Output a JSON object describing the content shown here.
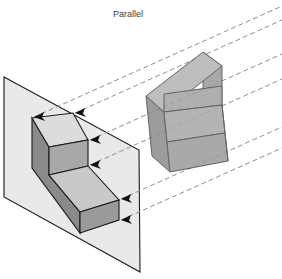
{
  "figure": {
    "title": "Parallel",
    "title_position": {
      "x": 128,
      "y": 17
    },
    "canvas": {
      "width": 282,
      "height": 279
    },
    "background_color": "#ffffff",
    "description_type": "parallel-projection-diagram"
  },
  "colors": {
    "background": "#ffffff",
    "plane_fill": "#e9e9e9",
    "plane_stroke": "#1a1a1a",
    "projected_top_fill": "#dcdcdc",
    "projected_front_fill": "#c9c9c9",
    "projected_side_fill": "#8a8a8a",
    "projected_step_fill": "#a8a8a8",
    "object_top_fill": "#b4b4b4",
    "object_front_fill": "#9c9c9c",
    "object_side_fill": "#8c8c8c",
    "object_stroke": "#4a4a4a",
    "outline_stroke": "#1a1a1a",
    "projector_dash": "#8e8e8e",
    "arrow_fill": "#111111",
    "title_color": "#3d3d3d"
  },
  "projection_plane": {
    "name": "picture-plane",
    "corners": [
      {
        "x": 4,
        "y": 77
      },
      {
        "x": 139,
        "y": 150
      },
      {
        "x": 140,
        "y": 272
      },
      {
        "x": 4,
        "y": 197
      }
    ]
  },
  "projected_shape": {
    "name": "projected-l-block-on-plane",
    "faces": [
      {
        "id": "top-upper-face",
        "points": "32,118 73,113 88,140 49,147"
      },
      {
        "id": "riser-face",
        "points": "49,147 88,140 88,166 49,175"
      },
      {
        "id": "lower-top-face",
        "points": "49,175 88,166 119,200 80,212"
      },
      {
        "id": "left-side-face",
        "points": "32,118 49,147 49,175 80,212 80,233 32,168"
      },
      {
        "id": "front-lower-face",
        "points": "80,212 119,200 119,220 80,233"
      }
    ]
  },
  "object_3d": {
    "name": "l-shaped-block",
    "faces": [
      {
        "id": "obj-top-face",
        "points": "146,96 203,52 222,66 164,112"
      },
      {
        "id": "obj-upper-right-face",
        "points": "203,52 222,66 222,105 203,92"
      },
      {
        "id": "obj-step-face",
        "points": "164,112 222,105 222,86 164,94"
      },
      {
        "id": "obj-lower-top-face",
        "points": "164,112 222,105 225,133 167,142"
      },
      {
        "id": "obj-front-face",
        "points": "167,142 225,133 228,161 170,172"
      },
      {
        "id": "obj-left-face",
        "points": "146,96 164,112 167,142 170,172 152,156 149,126"
      }
    ]
  },
  "projector_lines": {
    "name": "parallel-projector-rays",
    "style": "dashed",
    "dash_pattern": "5,3",
    "stroke_width": 1,
    "lines": [
      {
        "id": "ray-1",
        "x1": 34,
        "y1": 117,
        "x2": 282,
        "y2": 6
      },
      {
        "id": "ray-2",
        "x1": 75,
        "y1": 113,
        "x2": 282,
        "y2": 20
      },
      {
        "id": "ray-3",
        "x1": 90,
        "y1": 140,
        "x2": 282,
        "y2": 54
      },
      {
        "id": "ray-4",
        "x1": 90,
        "y1": 165,
        "x2": 282,
        "y2": 79
      },
      {
        "id": "ray-5",
        "x1": 121,
        "y1": 199,
        "x2": 282,
        "y2": 127
      },
      {
        "id": "ray-6",
        "x1": 121,
        "y1": 220,
        "x2": 282,
        "y2": 148
      }
    ]
  },
  "arrowheads": {
    "name": "projection-direction-arrows",
    "items": [
      {
        "id": "arrow-1",
        "x": 34,
        "y": 117,
        "angle": 204
      },
      {
        "id": "arrow-2",
        "x": 75,
        "y": 113,
        "angle": 204
      },
      {
        "id": "arrow-3",
        "x": 90,
        "y": 140,
        "angle": 204
      },
      {
        "id": "arrow-4",
        "x": 90,
        "y": 165,
        "angle": 204
      },
      {
        "id": "arrow-5",
        "x": 121,
        "y": 199,
        "angle": 204
      },
      {
        "id": "arrow-6",
        "x": 121,
        "y": 220,
        "angle": 204
      }
    ]
  }
}
